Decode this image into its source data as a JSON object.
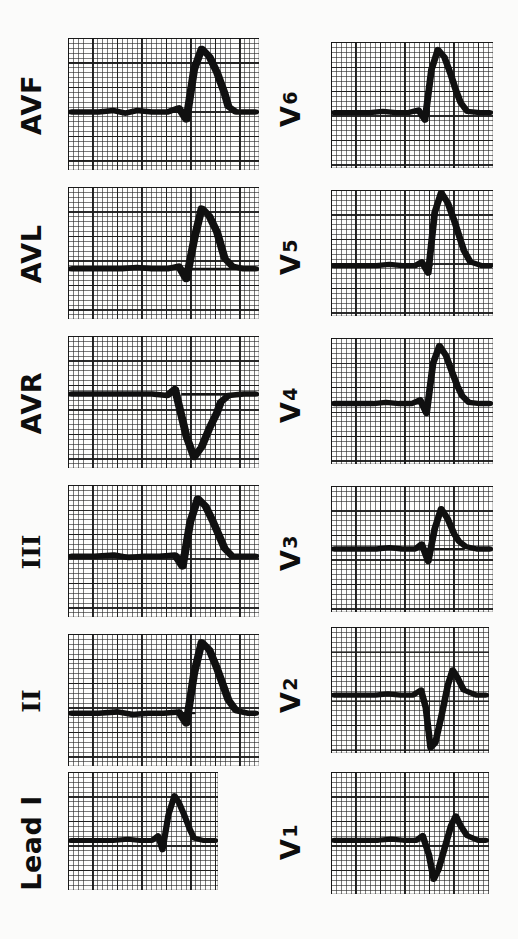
{
  "figure": {
    "orientation": "rotated-90-ccw",
    "background_color": "#fbfbfa",
    "trace_color": "#101010",
    "grid_color": "#282828",
    "paper_color": "#fdfdfc"
  },
  "columns": [
    {
      "name": "limb-leads",
      "leads": [
        {
          "id": "avf",
          "label": "AVF",
          "label_style": "soft"
        },
        {
          "id": "avl",
          "label": "AVL",
          "label_style": "soft"
        },
        {
          "id": "avr",
          "label": "AVR",
          "label_style": "soft"
        },
        {
          "id": "iii",
          "label": "III",
          "label_style": "roman"
        },
        {
          "id": "ii",
          "label": "II",
          "label_style": "roman"
        },
        {
          "id": "i",
          "label": "Lead I",
          "label_style": "soft"
        }
      ]
    },
    {
      "name": "precordial-leads",
      "leads": [
        {
          "id": "v6",
          "label": "V",
          "sub": "6",
          "label_style": "soft"
        },
        {
          "id": "v5",
          "label": "V",
          "sub": "5",
          "label_style": "soft"
        },
        {
          "id": "v4",
          "label": "V",
          "sub": "4",
          "label_style": "soft"
        },
        {
          "id": "v3",
          "label": "V",
          "sub": "3",
          "label_style": "soft"
        },
        {
          "id": "v2",
          "label": "V",
          "sub": "2",
          "label_style": "soft"
        },
        {
          "id": "v1",
          "label": "V",
          "sub": "1",
          "label_style": "soft"
        }
      ]
    }
  ],
  "chart_data": {
    "type": "line",
    "xlabel": "",
    "ylabel": "",
    "note": "Scanned ECG strip; each panel is one lead on standard 25 mm/s, 10 mm/mV graph paper, reproduced rotated 90 degrees counter-clockwise. Trace paths are given in panel-local coordinates of a 100 x 100 box, x = time, y = amplitude (0 = top).",
    "grid": {
      "fine_mm": 1,
      "bold_every": 5,
      "paper_speed": "25 mm/s",
      "gain": "10 mm/mV"
    },
    "series": [
      {
        "name": "AVF",
        "baseline_y": 56,
        "path": "M 2 56 L 16 56 L 24 55 L 30 57 L 36 55 L 44 56 L 52 56 L 58 53 L 62 62 L 66 24 L 70 8 L 74 14 L 78 26 L 80 34 L 82 42 L 84 52 L 88 56 L 98 56",
        "features": {
          "p_wave": "upright small",
          "qrs": "tall R",
          "t_wave": "low"
        }
      },
      {
        "name": "AVL",
        "baseline_y": 62,
        "path": "M 2 62 L 18 62 L 28 62 L 36 61 L 44 62 L 52 62 L 58 60 L 62 70 L 66 40 L 70 16 L 74 22 L 78 34 L 80 44 L 82 54 L 86 60 L 92 62 L 98 62",
        "features": {
          "p_wave": "flat",
          "qrs": "rS / small",
          "t_wave": "low"
        }
      },
      {
        "name": "AVR",
        "baseline_y": 44,
        "path": "M 2 44 L 20 44 L 34 44 L 44 44 L 52 45 L 56 40 L 58 52 L 62 76 L 66 92 L 70 84 L 74 70 L 78 58 L 80 50 L 84 45 L 92 44 L 98 44",
        "features": {
          "p_wave": "inverted",
          "qrs": "predominantly negative (QS)",
          "t_wave": "inverted"
        }
      },
      {
        "name": "III",
        "baseline_y": 54,
        "path": "M 2 54 L 14 54 L 24 53 L 32 55 L 40 54 L 48 54 L 56 53 L 60 62 L 64 28 L 68 10 L 72 16 L 76 28 L 79 38 L 82 48 L 86 54 L 94 54 L 98 54",
        "features": {
          "p_wave": "upright",
          "qrs": "tall R",
          "t_wave": "low"
        }
      },
      {
        "name": "II",
        "baseline_y": 60,
        "path": "M 2 60 L 16 60 L 26 59 L 34 61 L 42 60 L 50 60 L 58 59 L 62 68 L 66 30 L 70 6 L 74 12 L 78 26 L 81 38 L 84 50 L 88 58 L 94 60 L 98 60",
        "features": {
          "p_wave": "upright",
          "qrs": "tall R",
          "t_wave": "low"
        }
      },
      {
        "name": "Lead I",
        "baseline_y": 58,
        "path": "M 2 58 L 18 58 L 30 58 L 40 57 L 48 58 L 56 58 L 60 54 L 63 66 L 67 36 L 71 20 L 74 26 L 78 38 L 81 48 L 84 56 L 90 58 L 98 58",
        "features": {
          "p_wave": "small upright",
          "qrs": "qRs",
          "t_wave": "low"
        }
      },
      {
        "name": "V6",
        "baseline_y": 56,
        "path": "M 2 56 L 14 56 L 24 56 L 32 55 L 40 56 L 48 56 L 54 54 L 58 62 L 62 22 L 66 6 L 70 12 L 74 26 L 77 38 L 80 48 L 84 55 L 92 56 L 98 56",
        "features": {
          "qrs": "tall R",
          "t_wave": "low"
        }
      },
      {
        "name": "V5",
        "baseline_y": 60,
        "path": "M 2 60 L 16 60 L 28 60 L 36 59 L 44 60 L 52 60 L 56 57 L 60 66 L 64 18 L 68 2 L 72 10 L 76 24 L 79 36 L 82 48 L 86 57 L 93 60 L 98 60",
        "features": {
          "qrs": "tall R",
          "t_wave": "low"
        }
      },
      {
        "name": "V4",
        "baseline_y": 52,
        "path": "M 2 52 L 14 52 L 26 52 L 34 51 L 42 52 L 50 52 L 55 49 L 59 60 L 63 20 L 67 6 L 71 14 L 75 28 L 78 38 L 81 46 L 85 51 L 92 52 L 98 52",
        "features": {
          "qrs": "tall R",
          "t_wave": "low"
        }
      },
      {
        "name": "V3",
        "baseline_y": 50,
        "path": "M 2 50 L 16 50 L 28 50 L 36 49 L 44 50 L 52 50 L 56 46 L 60 60 L 64 34 L 68 18 L 72 26 L 76 38 L 79 44 L 83 48 L 90 50 L 98 50",
        "features": {
          "qrs": "transition / biphasic",
          "t_wave": "low"
        }
      },
      {
        "name": "V2",
        "baseline_y": 54,
        "path": "M 2 54 L 16 54 L 28 54 L 36 53 L 44 54 L 52 54 L 57 50 L 60 64 L 63 96 L 66 92 L 70 70 L 74 46 L 77 34 L 80 40 L 84 50 L 92 54 L 98 54",
        "features": {
          "qrs": "deep S wave (rS)",
          "t_wave": "low"
        }
      },
      {
        "name": "V1",
        "baseline_y": 56,
        "path": "M 2 56 L 18 56 L 30 56 L 38 55 L 46 56 L 54 56 L 58 52 L 62 68 L 65 88 L 68 80 L 72 62 L 76 44 L 79 36 L 82 44 L 86 52 L 93 56 L 98 56",
        "features": {
          "qrs": "rS",
          "t_wave": "low"
        }
      }
    ]
  }
}
